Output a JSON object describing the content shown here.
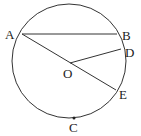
{
  "diagram": {
    "type": "circle-geometry",
    "stroke_color": "#333333",
    "circle": {
      "center": "O",
      "cx": 69,
      "cy": 61,
      "r": 57
    },
    "points": {
      "A": {
        "label": "A",
        "x": 22,
        "y": 34,
        "lx": 5,
        "ly": 39
      },
      "B": {
        "label": "B",
        "x": 117,
        "y": 34,
        "lx": 122,
        "ly": 40
      },
      "D": {
        "label": "D",
        "x": 121,
        "y": 49,
        "lx": 125,
        "ly": 57
      },
      "O": {
        "label": "O",
        "x": 70,
        "y": 63,
        "lx": 63,
        "ly": 78
      },
      "E": {
        "label": "E",
        "x": 116,
        "y": 90,
        "lx": 119,
        "ly": 99
      },
      "C": {
        "label": "C",
        "x": 74,
        "y": 118,
        "lx": 69,
        "ly": 132
      }
    },
    "segments": [
      {
        "from": "A",
        "to": "B"
      },
      {
        "from": "A",
        "to": "E"
      },
      {
        "from": "O",
        "to": "D"
      }
    ]
  }
}
